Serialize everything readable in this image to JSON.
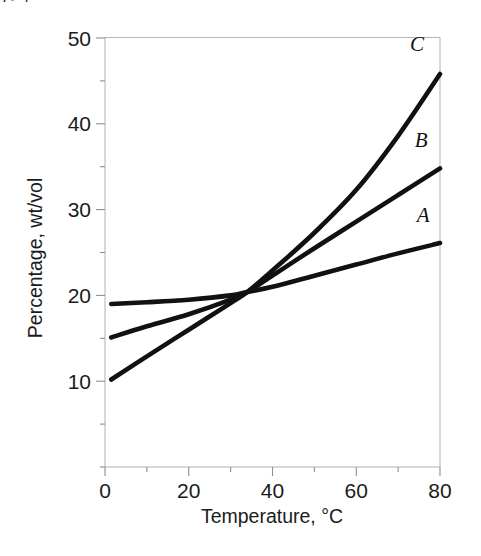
{
  "figure": {
    "caption_fragment": "|◦ ⌐"
  },
  "chart_data": {
    "type": "line",
    "title": "",
    "xlabel": "Temperature, °C",
    "ylabel": "Percentage, wt/vol",
    "xlim": [
      0,
      80
    ],
    "ylim": [
      0,
      50
    ],
    "x_major_ticks": [
      0,
      20,
      40,
      60,
      80
    ],
    "x_major_tick_labels": [
      "0",
      "20",
      "40",
      "60",
      "80"
    ],
    "x_minor_ticks": [
      10,
      30,
      50,
      70
    ],
    "y_major_ticks": [
      10,
      20,
      30,
      40,
      50
    ],
    "y_major_tick_labels": [
      "10",
      "20",
      "30",
      "40",
      "50"
    ],
    "y_minor_ticks": [
      5,
      15,
      25,
      35,
      45
    ],
    "grid": false,
    "legend_position": "inline-right-of-curve-ends",
    "line_color": "#111111",
    "frame_color": "#b9b9b9",
    "series": [
      {
        "name": "A",
        "label": "A",
        "label_x": 76.0,
        "label_y": 28.6,
        "x": [
          1.5,
          10,
          20,
          30,
          34,
          40,
          50,
          60,
          70,
          80
        ],
        "values": [
          19.0,
          19.2,
          19.5,
          20.0,
          20.4,
          21.0,
          22.3,
          23.6,
          24.9,
          26.1
        ]
      },
      {
        "name": "B",
        "label": "B",
        "label_x": 75.5,
        "label_y": 37.3,
        "x": [
          1.5,
          10,
          20,
          30,
          34,
          40,
          50,
          60,
          70,
          80
        ],
        "values": [
          15.1,
          16.4,
          17.8,
          19.5,
          20.4,
          22.3,
          25.5,
          28.6,
          31.7,
          34.8
        ]
      },
      {
        "name": "C",
        "label": "C",
        "label_x": 74.5,
        "label_y": 48.5,
        "x": [
          1.5,
          10,
          20,
          30,
          34,
          40,
          50,
          60,
          70,
          80
        ],
        "values": [
          10.2,
          12.9,
          16.0,
          19.1,
          20.4,
          22.9,
          27.3,
          32.3,
          38.6,
          45.8
        ]
      }
    ]
  }
}
